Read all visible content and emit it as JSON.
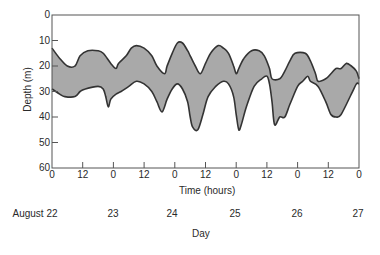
{
  "chart_data": {
    "type": "area",
    "title": "",
    "xlabel": "Time (hours)",
    "x2label": "Day",
    "ylabel": "Depth (m)",
    "ylim": [
      0,
      60
    ],
    "y_inverted": true,
    "xlim_hours": [
      0,
      120
    ],
    "grid": false,
    "legend": null,
    "y_ticks": [
      "0",
      "10",
      "20",
      "30",
      "40",
      "50",
      "60"
    ],
    "x_ticks": [
      "0",
      "12",
      "0",
      "12",
      "0",
      "12",
      "0",
      "12",
      "0",
      "12",
      "0"
    ],
    "day_labels": [
      "August 22",
      "23",
      "24",
      "25",
      "26",
      "27"
    ],
    "fill_color": "#a9a9a9",
    "line_color": "#333333",
    "series": [
      {
        "name": "Upper boundary (shallow edge)",
        "hours": [
          0,
          3,
          6,
          9,
          11,
          14,
          18,
          20,
          23,
          25,
          26,
          29,
          31,
          33,
          36,
          39,
          41,
          44,
          45,
          47,
          49,
          51,
          53,
          54,
          56,
          58,
          60,
          62,
          65,
          67,
          69,
          71,
          72,
          73,
          75,
          78,
          81,
          83,
          85,
          86,
          89,
          91,
          93,
          95,
          99,
          101,
          103,
          104,
          107,
          109,
          111,
          113,
          115,
          117,
          119,
          120
        ],
        "depth_m": [
          13,
          17,
          20,
          20,
          16,
          14,
          14,
          15,
          19,
          21,
          19,
          16,
          13,
          12,
          13,
          16,
          20,
          23,
          20,
          15,
          11,
          11,
          14,
          16,
          20,
          23,
          19,
          15,
          12,
          13,
          15,
          20,
          23,
          21,
          17,
          14,
          14,
          16,
          21,
          25,
          25,
          22,
          18,
          15,
          15,
          18,
          23,
          26,
          25,
          23,
          21,
          21,
          19,
          20,
          22,
          25
        ]
      },
      {
        "name": "Lower boundary (deep edge)",
        "hours": [
          0,
          3,
          5,
          9,
          11,
          13,
          18,
          20,
          21,
          22,
          23,
          25,
          27,
          30,
          33,
          36,
          39,
          41,
          43,
          45,
          47,
          49,
          51,
          53,
          54,
          55,
          57,
          59,
          61,
          64,
          67,
          69,
          71,
          72,
          73,
          74,
          76,
          79,
          82,
          84,
          85,
          86,
          87,
          89,
          91,
          93,
          96,
          98,
          100,
          101,
          104,
          107,
          109,
          111,
          113,
          117,
          119,
          120
        ],
        "depth_m": [
          29,
          31,
          32,
          32,
          30,
          29,
          28,
          29,
          32,
          36,
          33,
          31,
          30,
          28,
          26,
          27,
          30,
          34,
          38,
          33,
          29,
          27,
          29,
          34,
          40,
          44,
          45,
          39,
          32,
          28,
          26,
          27,
          32,
          39,
          45,
          43,
          36,
          28,
          25,
          24,
          27,
          34,
          43,
          40,
          40,
          35,
          28,
          26,
          24,
          26,
          28,
          34,
          39,
          40,
          39,
          31,
          27,
          27
        ]
      }
    ]
  },
  "axes": {
    "ylabel": "Depth (m)",
    "xlabel": "Time (hours)",
    "daylabel": "Day"
  }
}
